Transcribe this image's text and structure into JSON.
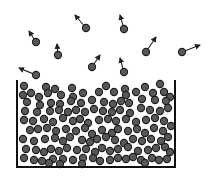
{
  "diagram": {
    "type": "evaporation-illustration",
    "colors": {
      "background": "#ffffff",
      "molecule_fill": "#585858",
      "molecule_stroke": "#1e1e1e",
      "arrow": "#222222",
      "container": "#111111"
    },
    "container": {
      "left": 17,
      "right": 175,
      "top": 80,
      "bottom": 167,
      "stroke_width": 2
    },
    "molecule_radius": 3.6,
    "escaping_molecules": [
      {
        "x": 36,
        "y": 42,
        "ax": 29,
        "ay": 31
      },
      {
        "x": 58,
        "y": 55,
        "ax": 57,
        "ay": 44
      },
      {
        "x": 86,
        "y": 28,
        "ax": 75,
        "ay": 15
      },
      {
        "x": 124,
        "y": 29,
        "ax": 120,
        "ay": 15
      },
      {
        "x": 36,
        "y": 75,
        "ax": 19,
        "ay": 68
      },
      {
        "x": 92,
        "y": 67,
        "ax": 100,
        "ay": 55
      },
      {
        "x": 124,
        "y": 72,
        "ax": 120,
        "ay": 58
      },
      {
        "x": 146,
        "y": 52,
        "ax": 156,
        "ay": 37
      },
      {
        "x": 182,
        "y": 52,
        "ax": 200,
        "ay": 45
      }
    ],
    "liquid_molecules": [
      [
        24,
        86
      ],
      [
        46,
        87
      ],
      [
        55,
        89
      ],
      [
        72,
        88
      ],
      [
        106,
        86
      ],
      [
        125,
        89
      ],
      [
        145,
        87
      ],
      [
        160,
        84
      ],
      [
        23,
        95
      ],
      [
        31,
        93
      ],
      [
        39,
        97
      ],
      [
        48,
        93
      ],
      [
        61,
        95
      ],
      [
        73,
        97
      ],
      [
        83,
        93
      ],
      [
        99,
        92
      ],
      [
        114,
        92
      ],
      [
        126,
        95
      ],
      [
        136,
        92
      ],
      [
        153,
        93
      ],
      [
        164,
        92
      ],
      [
        170,
        97
      ],
      [
        27,
        102
      ],
      [
        40,
        105
      ],
      [
        51,
        103
      ],
      [
        60,
        104
      ],
      [
        71,
        101
      ],
      [
        81,
        103
      ],
      [
        92,
        100
      ],
      [
        104,
        102
      ],
      [
        113,
        104
      ],
      [
        121,
        101
      ],
      [
        129,
        103
      ],
      [
        142,
        99
      ],
      [
        155,
        100
      ],
      [
        166,
        101
      ],
      [
        25,
        111
      ],
      [
        37,
        112
      ],
      [
        50,
        111
      ],
      [
        59,
        110
      ],
      [
        68,
        112
      ],
      [
        76,
        110
      ],
      [
        85,
        112
      ],
      [
        94,
        109
      ],
      [
        103,
        111
      ],
      [
        112,
        112
      ],
      [
        120,
        110
      ],
      [
        130,
        113
      ],
      [
        141,
        108
      ],
      [
        150,
        110
      ],
      [
        160,
        111
      ],
      [
        168,
        108
      ],
      [
        24,
        120
      ],
      [
        33,
        121
      ],
      [
        44,
        119
      ],
      [
        53,
        122
      ],
      [
        63,
        118
      ],
      [
        73,
        121
      ],
      [
        80,
        119
      ],
      [
        88,
        123
      ],
      [
        99,
        120
      ],
      [
        108,
        119
      ],
      [
        116,
        121
      ],
      [
        126,
        119
      ],
      [
        136,
        122
      ],
      [
        146,
        120
      ],
      [
        155,
        118
      ],
      [
        164,
        121
      ],
      [
        30,
        130
      ],
      [
        38,
        129
      ],
      [
        47,
        128
      ],
      [
        56,
        131
      ],
      [
        66,
        129
      ],
      [
        76,
        131
      ],
      [
        85,
        128
      ],
      [
        92,
        134
      ],
      [
        102,
        130
      ],
      [
        112,
        133
      ],
      [
        118,
        129
      ],
      [
        128,
        131
      ],
      [
        137,
        129
      ],
      [
        145,
        133
      ],
      [
        154,
        128
      ],
      [
        163,
        131
      ],
      [
        171,
        126
      ],
      [
        23,
        139
      ],
      [
        34,
        141
      ],
      [
        45,
        139
      ],
      [
        55,
        138
      ],
      [
        63,
        141
      ],
      [
        70,
        137
      ],
      [
        82,
        140
      ],
      [
        90,
        142
      ],
      [
        97,
        139
      ],
      [
        106,
        137
      ],
      [
        115,
        140
      ],
      [
        124,
        143
      ],
      [
        133,
        139
      ],
      [
        142,
        141
      ],
      [
        151,
        139
      ],
      [
        161,
        141
      ],
      [
        168,
        137
      ],
      [
        26,
        149
      ],
      [
        36,
        150
      ],
      [
        44,
        152
      ],
      [
        51,
        149
      ],
      [
        59,
        151
      ],
      [
        67,
        148
      ],
      [
        77,
        150
      ],
      [
        86,
        149
      ],
      [
        95,
        152
      ],
      [
        102,
        148
      ],
      [
        110,
        151
      ],
      [
        118,
        149
      ],
      [
        128,
        147
      ],
      [
        138,
        151
      ],
      [
        148,
        150
      ],
      [
        156,
        148
      ],
      [
        165,
        147
      ],
      [
        170,
        152
      ],
      [
        24,
        158
      ],
      [
        34,
        160
      ],
      [
        42,
        161
      ],
      [
        53,
        159
      ],
      [
        63,
        159
      ],
      [
        73,
        160
      ],
      [
        83,
        158
      ],
      [
        93,
        158
      ],
      [
        100,
        161
      ],
      [
        110,
        160
      ],
      [
        118,
        158
      ],
      [
        126,
        159
      ],
      [
        133,
        157
      ],
      [
        141,
        160
      ],
      [
        152,
        158
      ],
      [
        159,
        160
      ],
      [
        167,
        159
      ],
      [
        49,
        163
      ],
      [
        60,
        164
      ],
      [
        82,
        164
      ],
      [
        145,
        163
      ]
    ]
  }
}
